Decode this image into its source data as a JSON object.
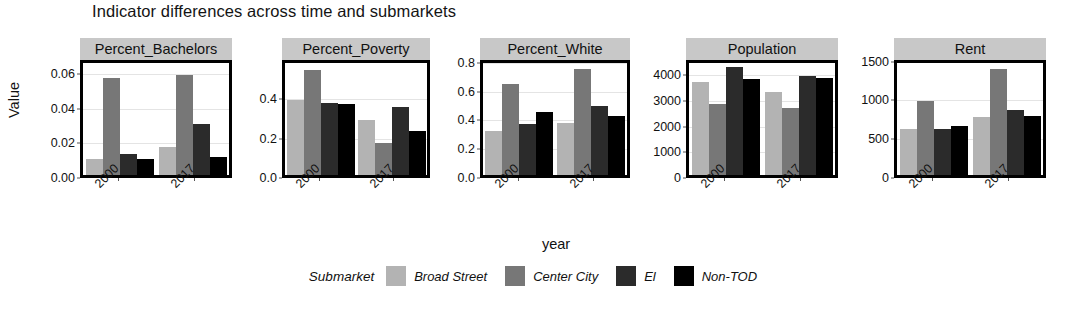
{
  "chart_data": {
    "type": "bar",
    "title": "Indicator differences across time and submarkets",
    "xlabel": "year",
    "ylabel": "Value",
    "grid": true,
    "legend_position": "bottom",
    "legend_title": "Submarket",
    "categories": [
      "2000",
      "2017"
    ],
    "series": [
      {
        "name": "Broad Street",
        "color": "#b3b3b3"
      },
      {
        "name": "Center City",
        "color": "#777777"
      },
      {
        "name": "El",
        "color": "#2b2b2b"
      },
      {
        "name": "Non-TOD",
        "color": "#000000"
      }
    ],
    "facets": [
      {
        "name": "Percent_Bachelors",
        "ylim": [
          0,
          0.068
        ],
        "yticks": [
          0.0,
          0.02,
          0.04,
          0.06
        ],
        "yticklabels": [
          "0.00",
          "0.02",
          "0.04",
          "0.06"
        ],
        "values": {
          "2000": [
            0.01,
            0.059,
            0.013,
            0.01
          ],
          "2017": [
            0.017,
            0.061,
            0.031,
            0.011
          ]
        }
      },
      {
        "name": "Percent_Poverty",
        "ylim": [
          0,
          0.6
        ],
        "yticks": [
          0.0,
          0.2,
          0.4
        ],
        "yticklabels": [
          "0.0",
          "0.2",
          "0.4"
        ],
        "values": {
          "2000": [
            0.4,
            0.56,
            0.385,
            0.38
          ],
          "2017": [
            0.295,
            0.17,
            0.365,
            0.235
          ]
        }
      },
      {
        "name": "Percent_White",
        "ylim": [
          0,
          0.82
        ],
        "yticks": [
          0.0,
          0.2,
          0.4,
          0.6,
          0.8
        ],
        "yticklabels": [
          "0.0",
          "0.2",
          "0.4",
          "0.6",
          "0.8"
        ],
        "values": {
          "2000": [
            0.325,
            0.67,
            0.37,
            0.465
          ],
          "2017": [
            0.38,
            0.775,
            0.505,
            0.435
          ]
        }
      },
      {
        "name": "Population",
        "ylim": [
          0,
          4600
        ],
        "yticks": [
          0,
          1000,
          2000,
          3000,
          4000
        ],
        "yticklabels": [
          "0",
          "1000",
          "2000",
          "3000",
          "4000"
        ],
        "values": {
          "2000": [
            3800,
            2900,
            4450,
            3950
          ],
          "2017": [
            3400,
            2750,
            4050,
            4000
          ]
        }
      },
      {
        "name": "Rent",
        "ylim": [
          0,
          1520
        ],
        "yticks": [
          0,
          500,
          1000,
          1500
        ],
        "yticklabels": [
          "0",
          "500",
          "1000",
          "1500"
        ],
        "values": {
          "2000": [
            620,
            1000,
            620,
            660
          ],
          "2017": [
            790,
            1440,
            880,
            800
          ]
        }
      }
    ]
  }
}
